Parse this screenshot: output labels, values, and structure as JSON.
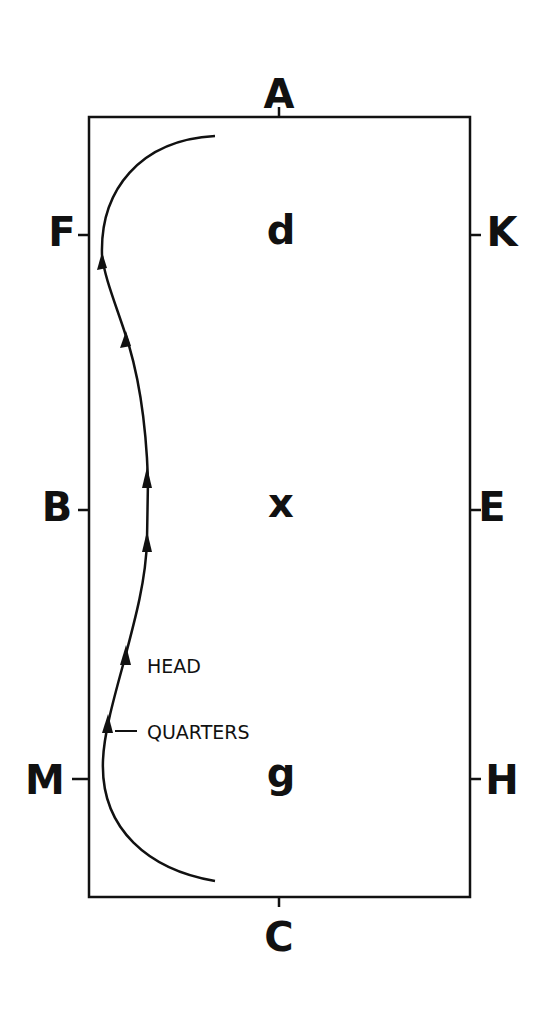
{
  "diagram": {
    "arena": {
      "x": 89,
      "y": 117,
      "width": 381,
      "height": 780,
      "stroke": "#111111"
    },
    "markers": [
      {
        "id": "A",
        "label": "A",
        "x": 279,
        "y": 97,
        "tick": [
          279,
          107,
          279,
          117
        ]
      },
      {
        "id": "F",
        "label": "F",
        "x": 60,
        "y": 235,
        "tick": [
          78,
          235,
          89,
          235
        ]
      },
      {
        "id": "K",
        "label": "K",
        "x": 500,
        "y": 235,
        "tick": [
          470,
          235,
          481,
          235
        ]
      },
      {
        "id": "B",
        "label": "B",
        "x": 57,
        "y": 510,
        "tick": [
          78,
          510,
          89,
          510
        ]
      },
      {
        "id": "E",
        "label": "E",
        "x": 490,
        "y": 510,
        "tick": [
          470,
          510,
          481,
          510
        ]
      },
      {
        "id": "M",
        "label": "M",
        "x": 45,
        "y": 783,
        "tick": [
          72,
          779,
          89,
          779
        ]
      },
      {
        "id": "H",
        "label": "H",
        "x": 500,
        "y": 783,
        "tick": [
          470,
          779,
          481,
          779
        ]
      },
      {
        "id": "C",
        "label": "C",
        "x": 279,
        "y": 940,
        "tick": [
          279,
          897,
          279,
          907
        ]
      }
    ],
    "centerline": [
      {
        "id": "d",
        "label": "d",
        "x": 281,
        "y": 233
      },
      {
        "id": "x",
        "label": "x",
        "x": 281,
        "y": 508
      },
      {
        "id": "g",
        "label": "g",
        "x": 281,
        "y": 780
      }
    ],
    "annotations": [
      {
        "id": "head",
        "label": "HEAD",
        "x": 147,
        "y": 667
      },
      {
        "id": "quarters",
        "label": "QUARTERS",
        "x": 147,
        "y": 733
      }
    ]
  }
}
